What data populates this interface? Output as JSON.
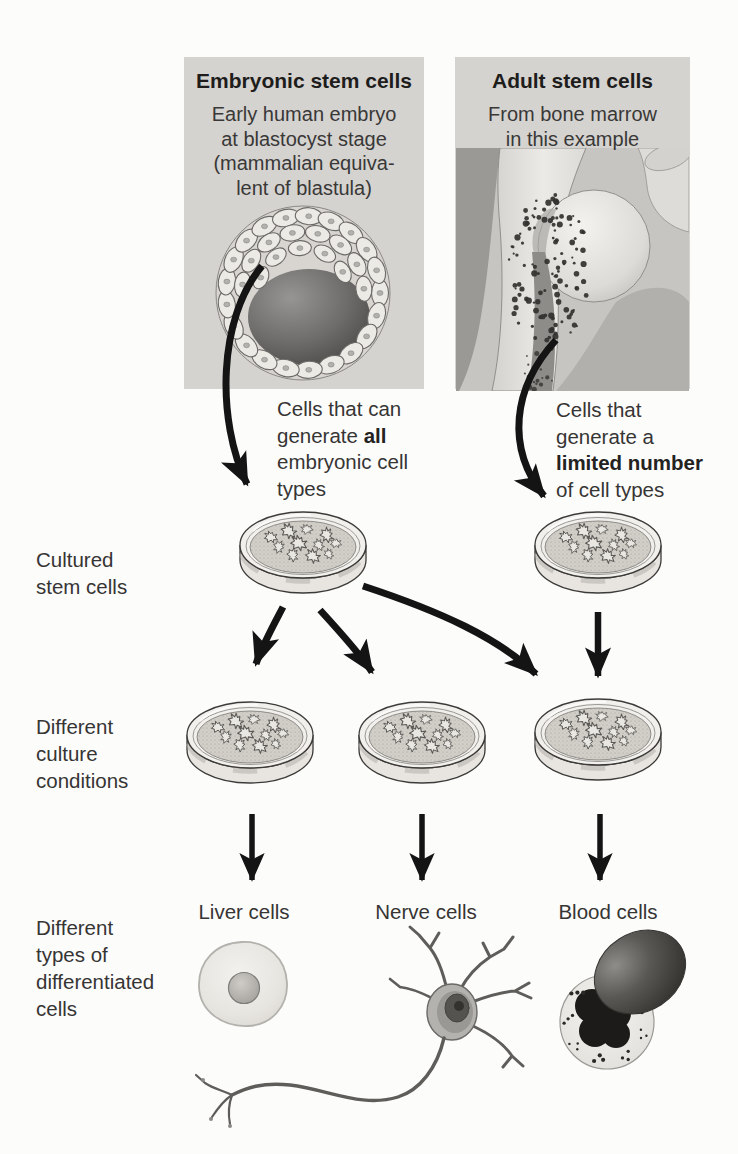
{
  "figure": {
    "panels": {
      "embryonic": {
        "title": "Embryonic stem cells",
        "subtitle_lines": [
          "Early human embryo",
          "at blastocyst stage",
          "(mammalian equiva-",
          "lent of blastula)"
        ]
      },
      "adult": {
        "title": "Adult stem cells",
        "subtitle_lines": [
          "From bone marrow",
          "in this example"
        ]
      }
    },
    "notes": {
      "embryonic": {
        "line1": "Cells that can",
        "line2_pre": "generate ",
        "line2_bold": "all",
        "line3": "embryonic cell",
        "line4": "types"
      },
      "adult": {
        "line1": "Cells that",
        "line2": "generate a",
        "line3_bold": "limited number",
        "line4": "of cell types"
      }
    },
    "row_labels": {
      "cultured": [
        "Cultured",
        "stem cells"
      ],
      "conditions": [
        "Different",
        "culture",
        "conditions"
      ],
      "differentiated": [
        "Different",
        "types of",
        "differentiated",
        "cells"
      ]
    },
    "cell_types": {
      "liver": "Liver cells",
      "nerve": "Nerve cells",
      "blood": "Blood cells"
    },
    "colors": {
      "panel_bg": "#d5d3d0",
      "text": "#363534",
      "arrow": "#141414",
      "dish_rim": "#f2f0ec",
      "dish_medium": "#d2cfc8",
      "cavity_dark": "#474543",
      "blood_dark": "#1d1b19"
    }
  }
}
